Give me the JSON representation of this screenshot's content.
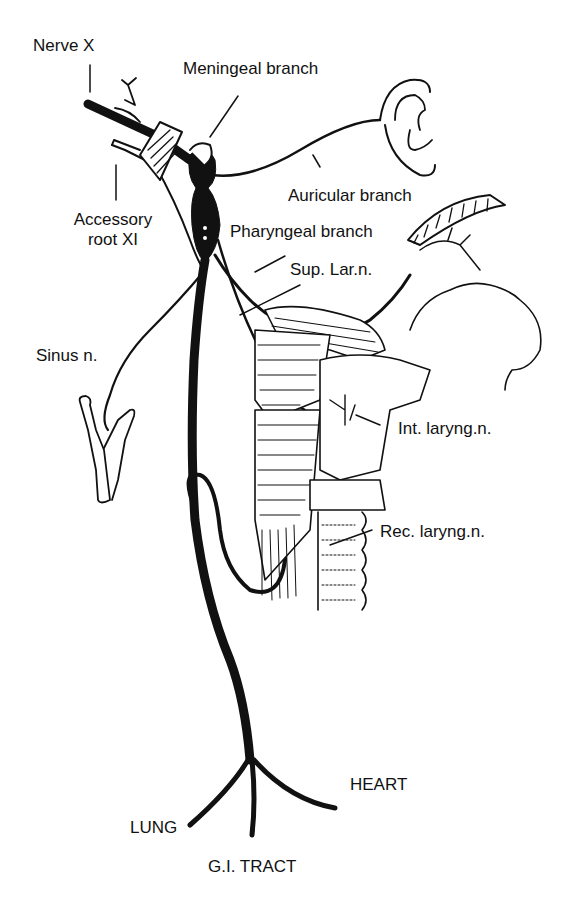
{
  "labels": {
    "nerve_x": "Nerve X",
    "meningeal": "Meningeal branch",
    "accessory_1": "Accessory",
    "accessory_2": "root XI",
    "auricular": "Auricular branch",
    "pharyngeal": "Pharyngeal branch",
    "sup_lar": "Sup. Lar.n.",
    "sinus": "Sinus n.",
    "int_laryng": "Int. laryng.n.",
    "rec_laryng": "Rec. laryng.n.",
    "heart": "HEART",
    "lung": "LUNG",
    "gi_tract": "G.I. TRACT"
  },
  "colors": {
    "ink": "#111111",
    "paper": "#ffffff"
  }
}
